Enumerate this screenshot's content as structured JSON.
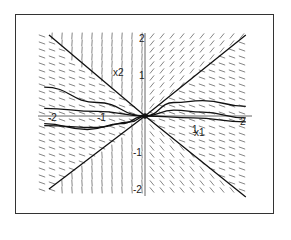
{
  "chart_data": {
    "type": "line",
    "subtype": "direction-field / phase portrait",
    "title": "",
    "xlabel": "x1",
    "ylabel": "x2",
    "xlim": [
      -2.1,
      2.1
    ],
    "ylim": [
      -2.1,
      2.1
    ],
    "x_ticks": [
      "-2",
      "-1",
      "1",
      "2"
    ],
    "y_ticks": [
      "2",
      "1",
      "-1",
      "-2"
    ],
    "origin_label": "0",
    "grid": false,
    "legend": null,
    "series": [
      {
        "name": "separatrix-1",
        "points": [
          [
            -2,
            -1.9
          ],
          [
            0,
            0
          ],
          [
            2.1,
            2.1
          ]
        ]
      },
      {
        "name": "separatrix-2",
        "points": [
          [
            -2,
            2.1
          ],
          [
            0,
            0
          ],
          [
            2.1,
            -2.1
          ]
        ]
      },
      {
        "name": "trajectory-upper",
        "points": [
          [
            -2.1,
            0.75
          ],
          [
            -1,
            0.35
          ],
          [
            0,
            0
          ],
          [
            0.6,
            0.35
          ],
          [
            1.2,
            0.4
          ],
          [
            2.1,
            0.25
          ]
        ]
      },
      {
        "name": "trajectory-mid",
        "points": [
          [
            -2.1,
            0.2
          ],
          [
            -1,
            0.12
          ],
          [
            0,
            0
          ],
          [
            1,
            -0.05
          ],
          [
            2.1,
            -0.15
          ]
        ]
      },
      {
        "name": "trajectory-lower",
        "points": [
          [
            -2.1,
            -0.25
          ],
          [
            -1,
            -0.3
          ],
          [
            -0.3,
            -0.15
          ],
          [
            0,
            0
          ],
          [
            0.6,
            0.15
          ],
          [
            1.2,
            0.1
          ],
          [
            2.1,
            -0.05
          ]
        ]
      },
      {
        "name": "trajectory-lowest",
        "points": [
          [
            -2.1,
            -0.2
          ],
          [
            -1.2,
            -0.35
          ],
          [
            -0.5,
            -0.2
          ],
          [
            0,
            0
          ]
        ]
      }
    ],
    "field": "short direction segments on a regular grid across the plot area"
  },
  "labels": {
    "xaxis": "x1",
    "yaxis": "x2",
    "xticks": [
      {
        "text": "-2",
        "x": 48,
        "y": 121
      },
      {
        "text": "-1",
        "x": 97,
        "y": 121
      },
      {
        "text": "1",
        "x": 192,
        "y": 133
      },
      {
        "text": "2",
        "x": 240,
        "y": 125
      }
    ],
    "yticks": [
      {
        "text": "2",
        "x": 139,
        "y": 42
      },
      {
        "text": "1",
        "x": 139,
        "y": 79
      },
      {
        "text": "-1",
        "x": 133,
        "y": 156
      },
      {
        "text": "-2",
        "x": 133,
        "y": 193
      }
    ]
  }
}
